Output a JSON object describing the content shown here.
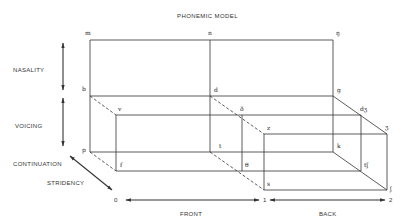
{
  "title": "PHONEMIC MODEL",
  "dimensions": {
    "nasality": "NASALITY",
    "voicing": "VOICING",
    "continuation": "CONTINUATION",
    "stridency": "STRIDENCY"
  },
  "axis": {
    "ticks": [
      "0",
      "1",
      "2"
    ],
    "front": "FRONT",
    "back": "BACK"
  },
  "phonemes": {
    "m": "m",
    "n": "n",
    "ng": "ŋ",
    "b": "b",
    "d": "d",
    "g": "g",
    "v": "v",
    "dh": "ð",
    "dzh": "dʒ",
    "z": "z",
    "zh": "ʒ",
    "p": "p",
    "t": "t",
    "k": "k",
    "f": "f",
    "th": "θ",
    "tsh": "tʃ",
    "s": "s",
    "sh": "ʃ"
  },
  "colors": {
    "line": "#333333",
    "text": "#333333",
    "background": "#ffffff"
  }
}
